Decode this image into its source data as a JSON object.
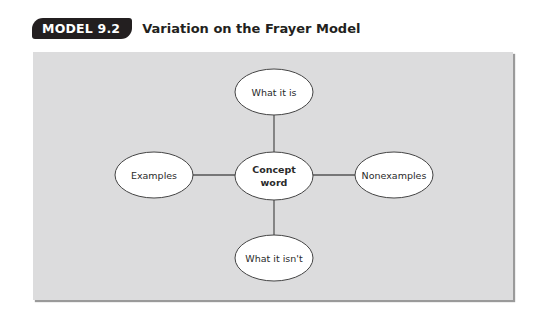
{
  "header": {
    "badge": "MODEL 9.2",
    "title": "Variation on the Frayer Model"
  },
  "diagram": {
    "center": {
      "line1": "Concept",
      "line2": "word"
    },
    "top": "What it is",
    "left": "Examples",
    "right": "Nonexamples",
    "bottom": "What it isn't"
  },
  "colors": {
    "badge_bg": "#231f20",
    "panel_bg": "#dcdcdd",
    "ellipse_fill": "#ffffff",
    "line": "#555555"
  }
}
